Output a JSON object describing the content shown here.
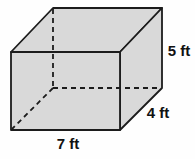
{
  "figure": {
    "kind": "rectangular-prism-diagram",
    "dimensions": {
      "height_label": "5 ft",
      "depth_label": "4 ft",
      "width_label": "7 ft"
    },
    "colors": {
      "face_fill": "#d9d9d9",
      "edge_stroke": "#1c1c1c",
      "background": "#fefefe",
      "label_color": "#111111"
    }
  }
}
